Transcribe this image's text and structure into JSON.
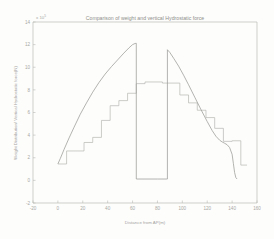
{
  "figure": {
    "background_color": "#fdfdfc",
    "axis_color": "#b9b9b4",
    "title": "Comparison of weight and vertical Hydrostatic force"
  },
  "chart_data": {
    "type": "line",
    "title": "Comparison of weight and vertical Hydrostatic force",
    "xlabel": "Distance from AP(m)",
    "ylabel": "Weight Distribution/ Vertical Hydrostatic force(N)",
    "y_exponent_label": "x 10",
    "y_exponent_power": "5",
    "xlim": [
      -20,
      160
    ],
    "ylim": [
      -2,
      14
    ],
    "xticks": [
      -20,
      0,
      20,
      40,
      60,
      80,
      100,
      120,
      140,
      160
    ],
    "yticks": [
      -2,
      0,
      2,
      4,
      6,
      8,
      10,
      12,
      14
    ],
    "grid": false,
    "legend": "none",
    "series": [
      {
        "name": "Vertical Hydrostatic force",
        "style": "smooth",
        "color": "#9a9a96",
        "x": [
          0,
          2,
          5,
          9,
          13,
          18,
          23,
          28,
          33,
          38,
          43,
          48,
          53,
          57,
          60,
          62,
          63,
          63,
          70,
          80,
          87,
          88,
          88,
          90,
          93,
          97,
          101,
          105,
          110,
          115,
          120,
          124,
          127,
          130,
          132,
          134,
          136,
          138,
          140,
          141,
          142,
          143,
          144
        ],
        "y": [
          1.45,
          1.95,
          2.75,
          3.75,
          4.7,
          5.85,
          6.85,
          7.8,
          8.65,
          9.4,
          10.05,
          10.65,
          11.25,
          11.7,
          12.0,
          12.1,
          12.12,
          0.12,
          0.12,
          0.12,
          0.12,
          0.12,
          11.55,
          11.3,
          10.8,
          10.1,
          9.3,
          8.45,
          7.35,
          6.25,
          5.2,
          4.4,
          3.9,
          3.55,
          3.4,
          3.28,
          3.15,
          2.9,
          2.3,
          1.5,
          0.7,
          0.25,
          0.12
        ]
      },
      {
        "name": "Weight Distribution",
        "style": "step",
        "color": "#b0b0ab",
        "step_edges": [
          0,
          7,
          14,
          21,
          28,
          35,
          42,
          49,
          56,
          63,
          70,
          77,
          84,
          91,
          98,
          105,
          112,
          119,
          126,
          133,
          140,
          147,
          152
        ],
        "step_values": [
          1.45,
          2.6,
          2.6,
          3.35,
          3.8,
          5.3,
          6.6,
          7.05,
          7.7,
          8.55,
          8.7,
          8.7,
          8.6,
          8.6,
          7.55,
          6.85,
          6.2,
          5.55,
          4.6,
          3.45,
          3.5,
          1.35
        ]
      }
    ]
  }
}
